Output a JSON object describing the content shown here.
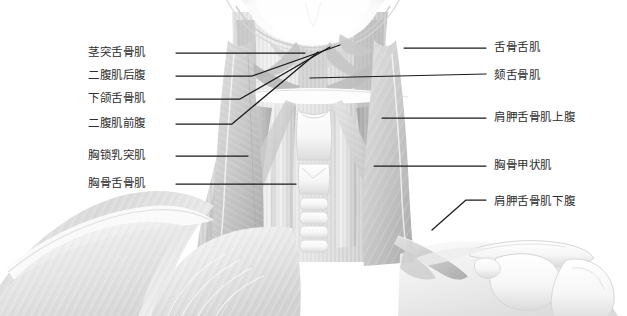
{
  "figure": {
    "background_color": "#ffffff",
    "label_color": "#2c2c2c",
    "leader_color": "#1a1a1a",
    "width": 627,
    "height": 316
  },
  "labels_left": [
    {
      "id": "styloglossus",
      "text": "茎突舌骨肌",
      "x": 88,
      "y": 47,
      "leader": "M176,53 L305,53"
    },
    {
      "id": "digastric-post",
      "text": "二腹肌后腹",
      "x": 88,
      "y": 70,
      "leader": "M176,76 L252,76 L340,45"
    },
    {
      "id": "mylohyoid",
      "text": "下颌舌骨肌",
      "x": 88,
      "y": 93,
      "leader": "M176,99 L240,99 L330,47"
    },
    {
      "id": "digastric-ant",
      "text": "二腹肌前腹",
      "x": 88,
      "y": 118,
      "leader": "M176,124 L232,124 L318,52"
    },
    {
      "id": "scm",
      "text": "胸锁乳突肌",
      "x": 88,
      "y": 150,
      "leader": "M176,156 L248,156"
    },
    {
      "id": "sternohyoid",
      "text": "胸骨舌骨肌",
      "x": 88,
      "y": 178,
      "leader": "M176,184 L296,184"
    }
  ],
  "labels_right": [
    {
      "id": "hyoglossus",
      "text": "舌骨舌肌",
      "x": 494,
      "y": 42,
      "leader": "M404,48 L486,48"
    },
    {
      "id": "geniohyoid",
      "text": "颏舌骨肌",
      "x": 494,
      "y": 70,
      "leader": "M310,78 L486,74"
    },
    {
      "id": "omohyoid-sup",
      "text": "肩胛舌骨肌上腹",
      "x": 494,
      "y": 112,
      "leader": "M382,118 L486,118"
    },
    {
      "id": "sternothyroid",
      "text": "胸骨甲状肌",
      "x": 494,
      "y": 160,
      "leader": "M374,166 L486,166"
    },
    {
      "id": "omohyoid-inf",
      "text": "肩胛舌骨肌下腹",
      "x": 494,
      "y": 196,
      "leader": "M432,230 L466,200 L486,200"
    }
  ]
}
